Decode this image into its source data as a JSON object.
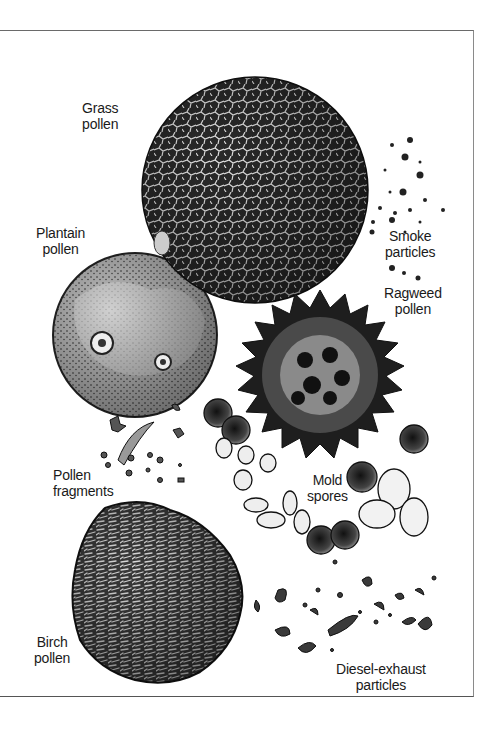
{
  "figure": {
    "labels": {
      "grass": {
        "line1": "Grass",
        "line2": "pollen"
      },
      "plantain": {
        "line1": "Plantain",
        "line2": "pollen"
      },
      "smoke": {
        "line1": "Smoke",
        "line2": "particles"
      },
      "ragweed": {
        "line1": "Ragweed",
        "line2": "pollen"
      },
      "fragments": {
        "line1": "Pollen",
        "line2": "fragments"
      },
      "mold": {
        "line1": "Mold",
        "line2": "spores"
      },
      "birch": {
        "line1": "Birch",
        "line2": "pollen"
      },
      "diesel": {
        "line1": "Diesel-exhaust",
        "line2": "particles"
      }
    },
    "colors": {
      "ink": "#1a1a1a",
      "paper": "#ffffff",
      "mid": "#555555"
    }
  }
}
